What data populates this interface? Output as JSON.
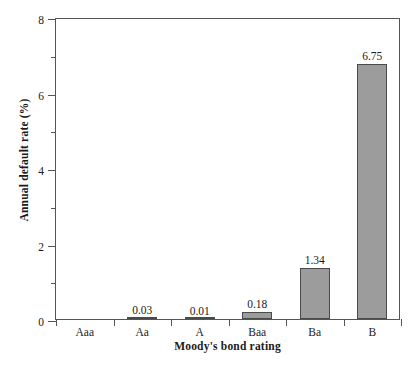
{
  "chart_data": {
    "type": "bar",
    "title": "",
    "xlabel": "Moody's bond rating",
    "ylabel": "Annual default rate (%)",
    "categories": [
      "Aaa",
      "Aa",
      "A",
      "Baa",
      "Ba",
      "B"
    ],
    "values": [
      0,
      0.03,
      0.01,
      0.18,
      1.34,
      6.75
    ],
    "value_labels": [
      "",
      "0.03",
      "0.01",
      "0.18",
      "1.34",
      "6.75"
    ],
    "ylim": [
      0,
      8
    ],
    "xlim_categories": 6,
    "y_major_ticks": [
      0,
      2,
      4,
      6,
      8
    ],
    "y_major_tick_labels": [
      "0",
      "2",
      "4",
      "6",
      "8"
    ],
    "y_minor_ticks": [
      1,
      3,
      5,
      7
    ],
    "grid": false,
    "legend": null,
    "bar_fill_color": "#9c9c9c",
    "bar_edge_color": "#4a4a4a",
    "axis_color": "#555555",
    "background_color": "#ffffff"
  }
}
